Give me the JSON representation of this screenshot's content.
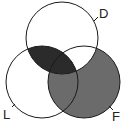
{
  "diagram": {
    "type": "venn",
    "sets": [
      {
        "id": "D",
        "label": "D",
        "cx": 62,
        "cy": 38,
        "r": 36
      },
      {
        "id": "L",
        "label": "L",
        "cx": 42,
        "cy": 82,
        "r": 36
      },
      {
        "id": "F",
        "label": "F",
        "cx": 84,
        "cy": 82,
        "r": 36
      }
    ],
    "shaded_regions": [
      {
        "region": "D∩L (including D∩L∩F)",
        "shade": "dark"
      },
      {
        "region": "F \\ D (F only and L∩F only)",
        "shade": "medium"
      }
    ],
    "unshaded_regions": [
      "D only",
      "L only",
      "D∩F only"
    ],
    "colors": {
      "dark": "#2b2b2b",
      "medium": "#6b6b6b",
      "outline": "#1a1a1a",
      "background": "#ffffff"
    }
  }
}
